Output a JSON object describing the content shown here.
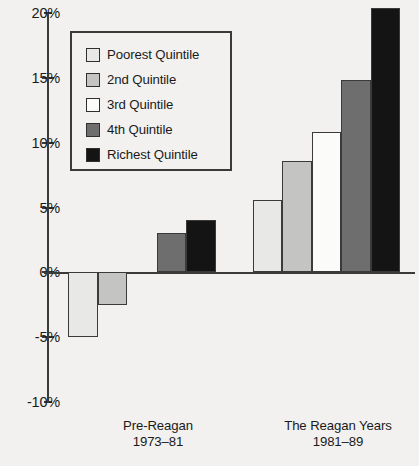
{
  "chart_data": {
    "type": "bar",
    "title": "",
    "xlabel": "",
    "ylabel": "",
    "ylim": [
      -10,
      20
    ],
    "ytick_labels": [
      "20%",
      "15%",
      "10%",
      "5%",
      "0%",
      "-5%",
      "-10%"
    ],
    "ytick_values": [
      20,
      15,
      10,
      5,
      0,
      -5,
      -10
    ],
    "grid": false,
    "legend_position": "upper-left-inside",
    "categories": [
      "Pre-Reagan 1973-81",
      "The Reagan Years 1981-89"
    ],
    "series": [
      {
        "name": "Poorest Quintile",
        "color": "#e8e8e6",
        "values": [
          -5.0,
          5.6
        ]
      },
      {
        "name": "2nd Quintile",
        "color": "#c4c4c2",
        "values": [
          -2.5,
          8.6
        ]
      },
      {
        "name": "3rd Quintile",
        "color": "#fbfbf9",
        "values": [
          0.0,
          10.8
        ]
      },
      {
        "name": "4th Quintile",
        "color": "#6e6e6e",
        "values": [
          3.0,
          14.8
        ]
      },
      {
        "name": "Richest Quintile",
        "color": "#141414",
        "values": [
          4.0,
          20.4
        ]
      }
    ]
  },
  "legend": {
    "items": [
      {
        "label": "Poorest Quintile"
      },
      {
        "label": "2nd Quintile"
      },
      {
        "label": "3rd Quintile"
      },
      {
        "label": "4th Quintile"
      },
      {
        "label": "Richest Quintile"
      }
    ]
  },
  "categories": [
    {
      "line1": "Pre-Reagan",
      "line2": "1973–81"
    },
    {
      "line1": "The Reagan Years",
      "line2": "1981–89"
    }
  ]
}
